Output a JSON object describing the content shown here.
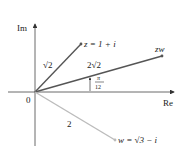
{
  "diagram": {
    "axes": {
      "x_label": "Re",
      "y_label": "Im",
      "origin_label": "0"
    },
    "vectors": [
      {
        "id": "z",
        "label": "z = 1 + i",
        "modulus_label": "√2",
        "color": "#555555"
      },
      {
        "id": "zw",
        "label": "zw",
        "modulus_label": "2√2",
        "color": "#555555"
      },
      {
        "id": "w",
        "label": "w = √3 − i",
        "modulus_label": "2",
        "color": "#bbbbbb"
      }
    ],
    "angle": {
      "numerator": "π",
      "denominator": "12"
    }
  }
}
